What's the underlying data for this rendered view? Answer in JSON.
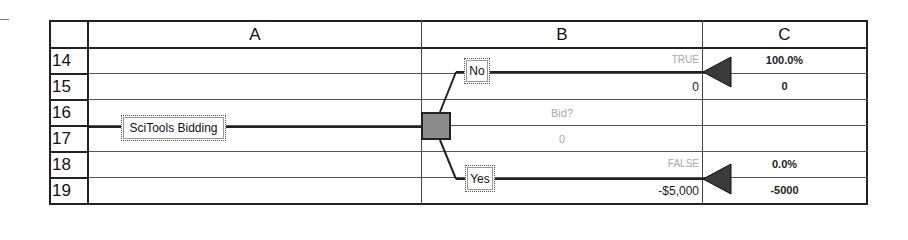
{
  "columns": [
    {
      "id": "A",
      "label": "A"
    },
    {
      "id": "B",
      "label": "B"
    },
    {
      "id": "C",
      "label": "C"
    }
  ],
  "rows": [
    "14",
    "15",
    "16",
    "17",
    "18",
    "19"
  ],
  "tree": {
    "root_label": "SciTools Bidding",
    "decision": {
      "name": "Bid?",
      "value": "0",
      "node_color": "#8c8c8c"
    },
    "branches": [
      {
        "label": "No",
        "flag": "TRUE",
        "payoff": "0",
        "probability": "100.0%",
        "end_value": "0"
      },
      {
        "label": "Yes",
        "flag": "FALSE",
        "payoff": "-$5,000",
        "probability": "0.0%",
        "end_value": "-5000"
      }
    ]
  }
}
